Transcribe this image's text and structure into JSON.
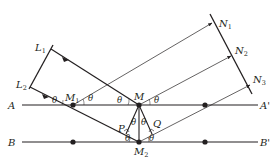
{
  "diagram": {
    "type": "crystal-diffraction-geometry",
    "colors": {
      "line": "#231f20",
      "background": "#ffffff"
    },
    "planes": [
      {
        "left_label": "A",
        "right_label": "A'"
      },
      {
        "left_label": "B",
        "right_label": "B'"
      }
    ],
    "points": {
      "M1": {
        "base": "M",
        "sub": "1"
      },
      "M": {
        "base": "M",
        "sub": ""
      },
      "M2": {
        "base": "M",
        "sub": "2"
      },
      "P": {
        "base": "P",
        "sub": ""
      },
      "Q": {
        "base": "Q",
        "sub": ""
      }
    },
    "incident_front": {
      "L1": {
        "base": "L",
        "sub": "1"
      },
      "L2": {
        "base": "L",
        "sub": "2"
      }
    },
    "reflected_front": {
      "N1": {
        "base": "N",
        "sub": "1"
      },
      "N2": {
        "base": "N",
        "sub": "2"
      },
      "N3": {
        "base": "N",
        "sub": "3"
      }
    },
    "angle_symbol": "θ",
    "angle_count": 10
  }
}
